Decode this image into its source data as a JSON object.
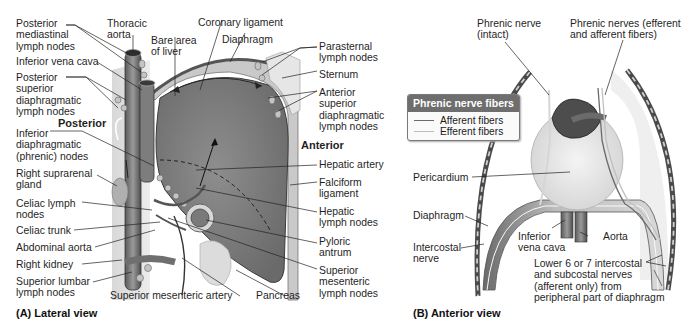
{
  "panel_a": {
    "caption": "(A) Lateral view",
    "orientation": {
      "posterior": "Posterior",
      "anterior": "Anterior"
    },
    "labels_left": [
      "Posterior\nmediastinal\nlymph nodes",
      "Inferior vena cava",
      "Posterior\nsuperior\ndiaphragmatic\nlymph nodes",
      "Inferior\ndiaphragmatic\n(phrenic) nodes",
      "Right suprarenal\ngland",
      "Celiac lymph\nnodes",
      "Celiac trunk",
      "Abdominal aorta",
      "Right kidney",
      "Superior lumbar\nlymph nodes"
    ],
    "labels_top": [
      "Thoracic\naorta",
      "Bare area\nof liver",
      "Coronary ligament",
      "Diaphragm"
    ],
    "labels_right": [
      "Parasternal\nlymph nodes",
      "Sternum",
      "Anterior\nsuperior\ndiaphragmatic\nlymph nodes",
      "Hepatic artery",
      "Falciform\nligament",
      "Hepatic\nlymph nodes",
      "Pyloric\nantrum",
      "Superior\nmesenteric\nlymph nodes"
    ],
    "labels_bottom": [
      "Superior mesenteric artery",
      "Pancreas"
    ]
  },
  "panel_b": {
    "caption": "(B)  Anterior view",
    "legend": {
      "title": "Phrenic nerve fibers",
      "items": [
        {
          "label": "Afferent fibers",
          "color": "#6b6b6b"
        },
        {
          "label": "Efferent fibers",
          "color": "#bdbdbd"
        }
      ],
      "header_color": "#6e6e6e"
    },
    "labels": {
      "phrenic_intact": "Phrenic nerve\n(intact)",
      "phrenic_both": "Phrenic nerves (efferent\nand afferent fibers)",
      "pericardium": "Pericardium",
      "diaphragm": "Diaphragm",
      "intercostal": "Intercostal\nnerve",
      "ivc": "Inferior\nvena cava",
      "aorta": "Aorta",
      "lower_nerves": "Lower 6 or 7 intercostal\nand subcostal nerves\n(afferent only) from\nperipheral part of diaphragm"
    }
  }
}
